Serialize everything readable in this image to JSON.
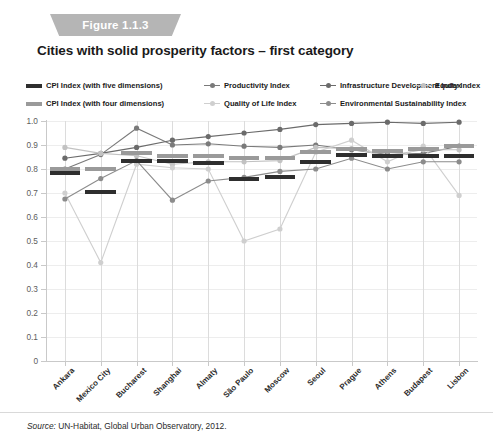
{
  "figure": {
    "banner_label": "Figure 1.1.3",
    "banner_color": "#b5b5b5",
    "title": "Cities with solid prosperity factors – first category",
    "source_prefix": "Source:",
    "source_text": " UN-Habitat, Global Urban Observatory, 2012."
  },
  "legend": {
    "rows": [
      [
        {
          "label": "CPI Index (with five dimensions)",
          "marker": "bar",
          "color": "#2e2e2e",
          "x": 0,
          "width": 178
        },
        {
          "label": "Productivity Index",
          "marker": "line-dot",
          "color": "#7a7a7a",
          "x": 178,
          "width": 116
        },
        {
          "label": "Infrastructure Development Index",
          "marker": "line-dot",
          "color": "#6b6b6b",
          "x": 294,
          "width": 152
        },
        {
          "label": "Equity Index",
          "marker": "line-dot",
          "color": "#c2c2c2",
          "x": 389,
          "width": 80
        }
      ],
      [
        {
          "label": "CPI Index (with four dimensions)",
          "marker": "bar",
          "color": "#9a9a9a",
          "x": 0,
          "width": 178
        },
        {
          "label": "Quality of Life Index",
          "marker": "line-dot",
          "color": "#cfcfcf",
          "x": 178,
          "width": 116
        },
        {
          "label": "Environmental Sustainability Index",
          "marker": "line-dot",
          "color": "#8c8c8c",
          "x": 294,
          "width": 152
        }
      ]
    ]
  },
  "chart_data": {
    "type": "line",
    "title": "Cities with solid prosperity factors – first category",
    "xlabel": "",
    "ylabel": "",
    "ylim": [
      0,
      1.0
    ],
    "ytick_labels": [
      "1.0",
      "0.9",
      "0.8",
      "0.7",
      "0.6",
      "0.5",
      "0.4",
      "0.3",
      "0.2",
      "0.1",
      "0"
    ],
    "ytick_values": [
      1.0,
      0.9,
      0.8,
      0.7,
      0.6,
      0.5,
      0.4,
      0.3,
      0.2,
      0.1,
      0
    ],
    "grid": true,
    "legend_position": "top",
    "categories": [
      "Ankara",
      "Mexico City",
      "Bucharest",
      "Shanghai",
      "Almaty",
      "São Paulo",
      "Moscow",
      "Seoul",
      "Prague",
      "Athens",
      "Budapest",
      "Lisbon"
    ],
    "series": [
      {
        "name": "CPI Index (with five dimensions)",
        "type": "bar-marker",
        "color": "#2e2e2e",
        "values": [
          0.785,
          0.705,
          0.835,
          0.835,
          0.825,
          0.76,
          0.765,
          0.83,
          0.86,
          0.855,
          0.855,
          0.855
        ]
      },
      {
        "name": "CPI Index (with four dimensions)",
        "type": "bar-marker",
        "color": "#9a9a9a",
        "values": [
          0.8,
          0.8,
          0.865,
          0.855,
          0.855,
          0.845,
          0.845,
          0.87,
          0.885,
          0.875,
          0.885,
          0.895
        ]
      },
      {
        "name": "Productivity Index",
        "type": "line",
        "color": "#7a7a7a",
        "values": [
          0.8,
          0.86,
          0.97,
          0.9,
          0.905,
          0.895,
          0.89,
          0.9,
          0.88,
          0.86,
          0.865,
          0.895
        ]
      },
      {
        "name": "Infrastructure Development Index",
        "type": "line",
        "color": "#6b6b6b",
        "values": [
          0.845,
          0.865,
          0.89,
          0.92,
          0.935,
          0.95,
          0.965,
          0.985,
          0.99,
          0.995,
          0.99,
          0.995
        ]
      },
      {
        "name": "Equity Index",
        "type": "line",
        "color": "#c2c2c2",
        "values": [
          0.89,
          0.865,
          0.855,
          0.82,
          0.83,
          0.83,
          0.835,
          0.89,
          0.885,
          0.855,
          0.88,
          0.88
        ]
      },
      {
        "name": "Quality of Life Index",
        "type": "line",
        "color": "#cfcfcf",
        "values": [
          0.7,
          0.41,
          0.82,
          0.805,
          0.8,
          0.5,
          0.55,
          0.87,
          0.92,
          0.83,
          0.895,
          0.69
        ]
      },
      {
        "name": "Environmental Sustainability Index",
        "type": "line",
        "color": "#8c8c8c",
        "values": [
          0.675,
          0.76,
          0.835,
          0.67,
          0.75,
          0.765,
          0.79,
          0.8,
          0.845,
          0.8,
          0.83,
          0.83
        ]
      }
    ]
  }
}
